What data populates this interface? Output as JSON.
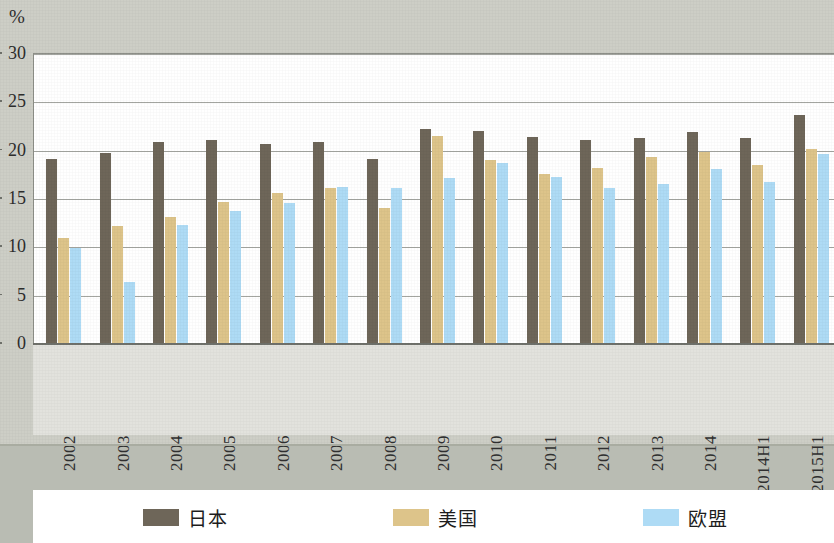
{
  "chart_data": {
    "type": "bar",
    "title": "",
    "xlabel": "",
    "ylabel": "%",
    "ylim": [
      0,
      30
    ],
    "yticks": [
      0,
      5,
      10,
      15,
      20,
      25,
      30
    ],
    "grid": true,
    "legend_position": "bottom",
    "categories": [
      "2002",
      "2003",
      "2004",
      "2005",
      "2006",
      "2007",
      "2008",
      "2009",
      "2010",
      "2011",
      "2012",
      "2013",
      "2014",
      "2014H1",
      "2015H1"
    ],
    "series": [
      {
        "name": "日本",
        "color": "#6e6659",
        "values": [
          19.0,
          19.7,
          20.8,
          21.0,
          20.6,
          20.8,
          19.0,
          22.1,
          21.9,
          21.3,
          21.0,
          21.2,
          21.8,
          21.2,
          23.6
        ]
      },
      {
        "name": "美国",
        "color": "#ddc48a",
        "values": [
          10.9,
          12.1,
          13.0,
          14.6,
          15.5,
          16.0,
          14.0,
          21.4,
          18.9,
          17.5,
          18.1,
          19.2,
          19.8,
          18.4,
          20.1
        ]
      },
      {
        "name": "欧盟",
        "color": "#aedbf5",
        "values": [
          9.8,
          6.3,
          12.2,
          13.7,
          14.5,
          16.1,
          16.0,
          17.1,
          18.6,
          17.2,
          16.0,
          16.5,
          18.0,
          16.7,
          19.6
        ]
      }
    ]
  },
  "legend": {
    "items": [
      {
        "label": "日本",
        "color": "#6e6659"
      },
      {
        "label": "美国",
        "color": "#ddc48a"
      },
      {
        "label": "欧盟",
        "color": "#aedbf5"
      }
    ]
  },
  "axis": {
    "unit_label": "%"
  }
}
